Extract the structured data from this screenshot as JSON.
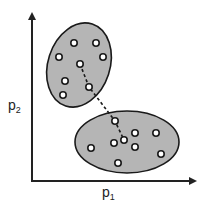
{
  "diagram": {
    "type": "cluster-scatter",
    "x_axis": {
      "label": "p",
      "subscript": "1"
    },
    "y_axis": {
      "label": "p",
      "subscript": "2"
    },
    "colors": {
      "axis": "#222222",
      "cluster_fill": "#b5b5b5",
      "cluster_stroke": "#1a1a1a",
      "point_fill": "#ffffff",
      "point_stroke": "#1a1a1a",
      "link": "#1a1a1a"
    },
    "clusters": [
      {
        "name": "upper-cluster",
        "ellipse": {
          "cx": 79,
          "cy": 65,
          "rx": 31,
          "ry": 43,
          "rotate": 18
        },
        "points": [
          [
            74,
            43
          ],
          [
            96,
            43
          ],
          [
            59,
            57
          ],
          [
            103,
            57
          ],
          [
            80,
            64
          ],
          [
            65,
            81
          ],
          [
            89,
            87
          ],
          [
            63,
            95
          ]
        ]
      },
      {
        "name": "lower-cluster",
        "ellipse": {
          "cx": 127,
          "cy": 142,
          "rx": 52,
          "ry": 31,
          "rotate": 0
        },
        "points": [
          [
            115,
            121
          ],
          [
            135,
            133
          ],
          [
            156,
            133
          ],
          [
            114,
            143
          ],
          [
            124,
            140
          ],
          [
            135,
            147
          ],
          [
            91,
            148
          ],
          [
            161,
            154
          ],
          [
            118,
            163
          ]
        ]
      }
    ],
    "link": {
      "style": "dashed",
      "path": [
        [
          80,
          64
        ],
        [
          89,
          87
        ],
        [
          115,
          121
        ],
        [
          124,
          140
        ]
      ]
    }
  }
}
